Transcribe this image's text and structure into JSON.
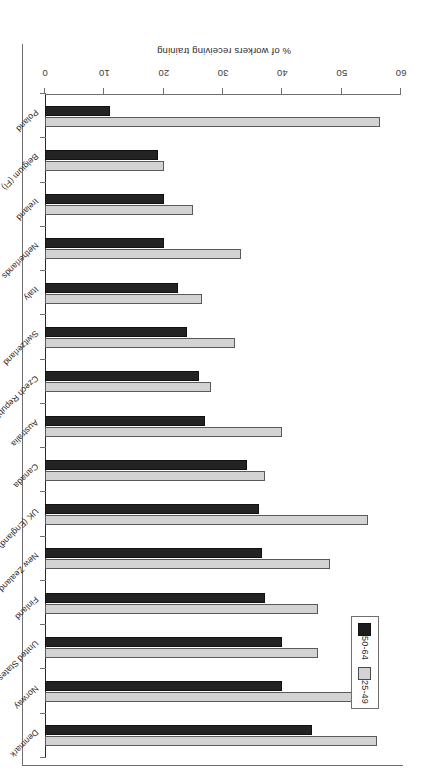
{
  "chart_data": {
    "type": "bar",
    "orientation": "horizontal",
    "title": "",
    "xlabel": "% of workers receiving training",
    "ylabel": "",
    "xlim": [
      0,
      60
    ],
    "xticks": [
      0,
      10,
      20,
      30,
      40,
      50,
      60
    ],
    "grid": false,
    "legend_position": "upper-right-of-plot",
    "categories": [
      "Denmark",
      "Norway",
      "United States",
      "Finland",
      "New Zealand",
      "UK (England)",
      "Canada",
      "Australia",
      "Czech Republic",
      "Switzerland",
      "Italy",
      "Netherlands",
      "Ireland",
      "Belgium (Fl)",
      "Poland"
    ],
    "series": [
      {
        "name": "25-49",
        "color": "#d3d3d3",
        "values": [
          56,
          52,
          46,
          46,
          48,
          54.5,
          37,
          40,
          28,
          32,
          26.5,
          33,
          25,
          20,
          56.5
        ]
      },
      {
        "name": "50-64",
        "color": "#232323",
        "values": [
          45,
          40,
          40,
          37,
          36.5,
          36,
          34,
          27,
          26,
          24,
          22.5,
          20,
          20,
          19,
          11
        ]
      }
    ]
  },
  "axis": {
    "tick_labels": [
      "0",
      "10",
      "20",
      "30",
      "40",
      "50",
      "60"
    ],
    "value_axis_title": "% of workers receiving training"
  },
  "legend": {
    "entries": [
      {
        "label": "50-64",
        "swatch": "dark-square-swatch"
      },
      {
        "label": "25-49",
        "swatch": "light-square-swatch"
      }
    ]
  }
}
